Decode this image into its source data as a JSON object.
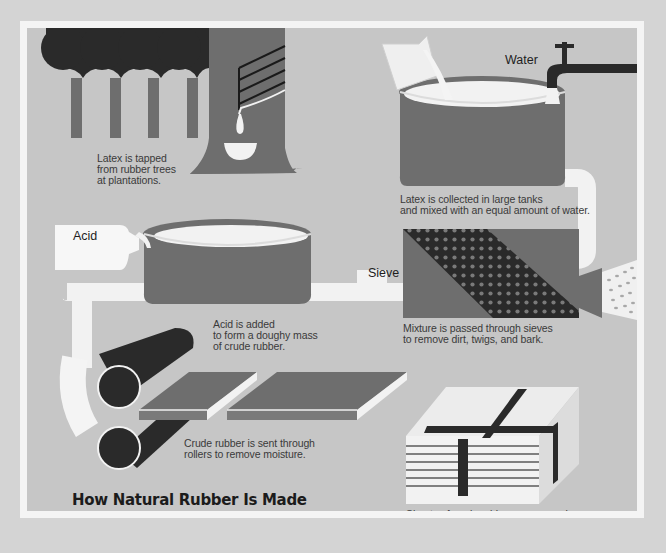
{
  "title": "How Natural Rubber Is Made",
  "colors": {
    "page_background": "#d4d4d4",
    "frame_border": "#f4f4f4",
    "panel_background": "#c6c6c6",
    "tank_gray": "#6e6e6e",
    "dark": "#262626",
    "latex_white": "#f2f2f2"
  },
  "labels": {
    "water": "Water",
    "acid": "Acid",
    "sieve": "Sieve"
  },
  "steps": [
    {
      "id": "tap",
      "caption": "Latex is tapped\nfrom rubber trees\nat plantations."
    },
    {
      "id": "collect",
      "caption": "Latex is collected in large tanks\nand mixed with an equal amount of water."
    },
    {
      "id": "sieve",
      "caption": "Mixture is passed through sieves\nto remove dirt, twigs, and bark."
    },
    {
      "id": "acid",
      "caption": "Acid is added\nto form a doughy mass\nof crude rubber."
    },
    {
      "id": "roll",
      "caption": "Crude rubber is sent through\nrollers to remove moisture."
    },
    {
      "id": "bale",
      "caption": "Sheets of crude rubber are pressed\ninto bales and shipped to manufacturer."
    }
  ]
}
